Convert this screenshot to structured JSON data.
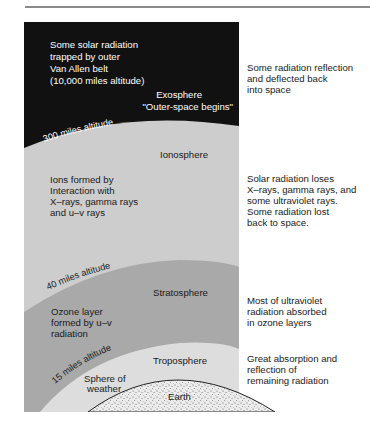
{
  "diagram": {
    "layers": [
      {
        "name": "Exosphere",
        "subtitle": "\"Outer-space begins\"",
        "inner_note": [
          "Some solar radiation",
          "trapped by outer",
          "Van Allen belt",
          "(10,000 miles altitude)"
        ],
        "side_note": "Some radiation reflection\nand deflected back\ninto space",
        "color": "#111111"
      },
      {
        "name": "Ionosphere",
        "boundary_label": "300 miles altitude",
        "inner_note": [
          "Ions formed by",
          "Interaction with",
          "X–rays, gamma rays",
          "and u–v rays"
        ],
        "side_note": "Solar radiation loses\nX–rays, gamma rays, and\nsome ultraviolet rays.\nSome radiation lost\nback to space.",
        "color": "#cdcdcd"
      },
      {
        "name": "Stratosphere",
        "boundary_label": "40 miles altitude",
        "inner_note": [
          "Ozone layer",
          "formed by u–v",
          "radiation"
        ],
        "side_note": "Most of ultraviolet\nradiation absorbed\nin ozone layers",
        "color": "#a9a9a9"
      },
      {
        "name": "Troposphere",
        "boundary_label": "15 miles altitude",
        "inner_note": [
          "Sphere of",
          "weather"
        ],
        "side_note": "Great absorption and\nreflection of\nremaining radiation",
        "color": "#dddddd"
      },
      {
        "name": "Earth",
        "color": "#e8e8e8"
      }
    ]
  }
}
